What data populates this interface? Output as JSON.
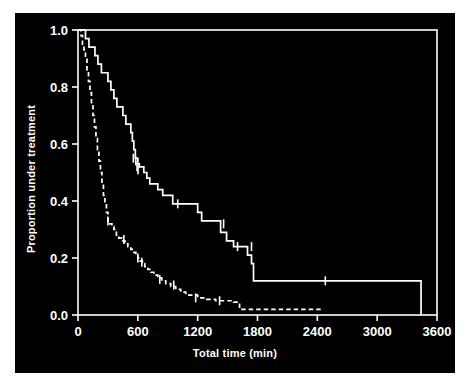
{
  "figure": {
    "background": "#000000",
    "foreground": "#ffffff",
    "edge_note": "|||||||"
  },
  "chart_data": {
    "type": "line",
    "subtype": "kaplan-meier-step",
    "title": "",
    "xlabel": "Total time (min)",
    "ylabel": "Proportion under treatment",
    "xlim": [
      0,
      3600
    ],
    "ylim": [
      0.0,
      1.0
    ],
    "xticks": [
      0,
      600,
      1200,
      1800,
      2400,
      3000,
      3600
    ],
    "xticklabels": [
      "0",
      "600",
      "1200",
      "1800",
      "2400",
      "3000",
      "3600"
    ],
    "yticks": [
      0.0,
      0.2,
      0.4,
      0.6,
      0.8,
      1.0
    ],
    "yticklabels": [
      "0.0",
      "0.2",
      "0.4",
      "0.6",
      "0.8",
      "1.0"
    ],
    "grid": false,
    "legend": false,
    "legend_position": "none",
    "series": [
      {
        "name": "solid-curve",
        "style": "solid",
        "color": "#ffffff",
        "x": [
          0,
          60,
          75,
          110,
          140,
          170,
          200,
          235,
          265,
          300,
          330,
          360,
          390,
          420,
          450,
          480,
          505,
          530,
          545,
          560,
          575,
          590,
          600,
          615,
          640,
          660,
          690,
          720,
          760,
          800,
          850,
          900,
          950,
          1010,
          1100,
          1200,
          1240,
          1330,
          1430,
          1490,
          1560,
          1620,
          1680,
          1700,
          1740,
          1760,
          3440,
          3440
        ],
        "y": [
          1.0,
          1.0,
          0.97,
          0.94,
          0.94,
          0.91,
          0.88,
          0.85,
          0.85,
          0.82,
          0.79,
          0.76,
          0.73,
          0.73,
          0.7,
          0.67,
          0.67,
          0.64,
          0.61,
          0.58,
          0.55,
          0.55,
          0.53,
          0.52,
          0.52,
          0.5,
          0.48,
          0.46,
          0.46,
          0.44,
          0.42,
          0.42,
          0.39,
          0.39,
          0.39,
          0.36,
          0.33,
          0.33,
          0.29,
          0.26,
          0.24,
          0.24,
          0.24,
          0.21,
          0.18,
          0.12,
          0.12,
          0.0
        ],
        "censor_x": [
          555,
          580,
          592,
          602,
          1000,
          1460,
          1600,
          1740,
          2480
        ],
        "censor_y": [
          0.55,
          0.54,
          0.52,
          0.51,
          0.39,
          0.32,
          0.24,
          0.24,
          0.12
        ]
      },
      {
        "name": "dashed-curve",
        "style": "dashed",
        "color": "#ffffff",
        "x": [
          0,
          30,
          45,
          60,
          75,
          90,
          105,
          120,
          135,
          150,
          165,
          180,
          195,
          210,
          225,
          240,
          255,
          270,
          285,
          300,
          320,
          340,
          360,
          385,
          410,
          440,
          470,
          500,
          530,
          560,
          580,
          600,
          620,
          645,
          670,
          700,
          730,
          760,
          800,
          840,
          880,
          930,
          980,
          1030,
          1080,
          1200,
          1290,
          1380,
          1470,
          1560,
          1620,
          2440
        ],
        "y": [
          1.0,
          0.98,
          0.95,
          0.93,
          0.9,
          0.86,
          0.82,
          0.78,
          0.74,
          0.7,
          0.66,
          0.62,
          0.58,
          0.54,
          0.5,
          0.46,
          0.42,
          0.39,
          0.36,
          0.33,
          0.32,
          0.31,
          0.3,
          0.28,
          0.27,
          0.26,
          0.25,
          0.24,
          0.23,
          0.22,
          0.21,
          0.2,
          0.19,
          0.18,
          0.17,
          0.16,
          0.15,
          0.14,
          0.13,
          0.12,
          0.11,
          0.1,
          0.09,
          0.08,
          0.07,
          0.06,
          0.055,
          0.05,
          0.05,
          0.045,
          0.02,
          0.02
        ],
        "censor_x": [
          300,
          460,
          600,
          640,
          820,
          960,
          1180,
          1420
        ],
        "censor_y": [
          0.33,
          0.265,
          0.2,
          0.185,
          0.125,
          0.105,
          0.06,
          0.05
        ]
      }
    ]
  }
}
